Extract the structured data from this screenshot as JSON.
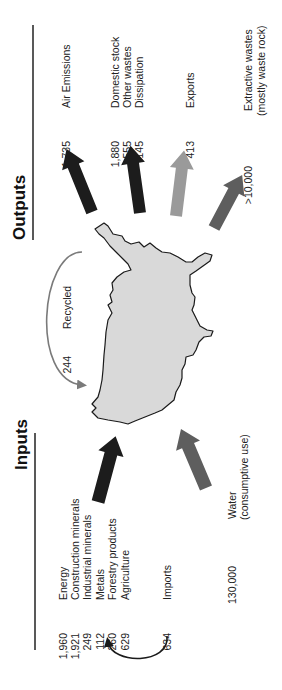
{
  "diagram": {
    "type": "material-flow",
    "orientation": "rotated-90-ccw",
    "colors": {
      "dark_arrow": "#1c1c1c",
      "medium_arrow": "#5e5e5e",
      "light_arrow": "#9a9a9a",
      "map_fill": "#d9d9d9",
      "map_stroke": "#1a1a1a",
      "recycle_arc": "#7a7a7a"
    },
    "inputs": {
      "header": "Inputs",
      "items": [
        {
          "value": "1,960",
          "label": "Energy"
        },
        {
          "value": "1,921",
          "label": "Construction minerals"
        },
        {
          "value": "249",
          "label": "Industrial minerals"
        },
        {
          "value": "112",
          "label": "Metals"
        },
        {
          "value": "260",
          "label": "Forestry products"
        },
        {
          "value": "629",
          "label": "Agriculture"
        }
      ],
      "imports": {
        "value": "634",
        "label": "Imports"
      },
      "water": {
        "value": "130,000",
        "label": "Water",
        "sublabel": "(consumptive use)"
      }
    },
    "recycled": {
      "value": "244",
      "label": "Recycled"
    },
    "outputs": {
      "header": "Outputs",
      "air": {
        "value": "1,735",
        "label": "Air Emissions"
      },
      "domestic": [
        {
          "value": "1,880",
          "label": "Domestic stock"
        },
        {
          "value": "555",
          "label": "Other wastes"
        },
        {
          "value": "145",
          "label": "Dissipation"
        }
      ],
      "exports": {
        "value": "413",
        "label": "Exports"
      },
      "extractive": {
        "value": ">10,000",
        "label": "Extractive wastes",
        "sublabel": "(mostly waste rock)"
      }
    }
  }
}
